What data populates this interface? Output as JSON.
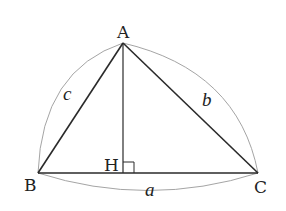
{
  "diagram": {
    "type": "triangle-with-altitude",
    "vertices": {
      "A": {
        "label": "A",
        "x": 123,
        "y": 43
      },
      "B": {
        "label": "B",
        "x": 38,
        "y": 173
      },
      "C": {
        "label": "C",
        "x": 258,
        "y": 173
      },
      "H": {
        "label": "H",
        "x": 123,
        "y": 173
      }
    },
    "sides": {
      "a": {
        "label": "a",
        "from": "B",
        "to": "C"
      },
      "b": {
        "label": "b",
        "from": "A",
        "to": "C"
      },
      "c": {
        "label": "c",
        "from": "A",
        "to": "B"
      }
    },
    "altitude": {
      "from": "A",
      "to": "H",
      "right_angle_marker": true
    },
    "colors": {
      "line": "#2a2a2a",
      "arc": "#9a9a9a"
    }
  }
}
